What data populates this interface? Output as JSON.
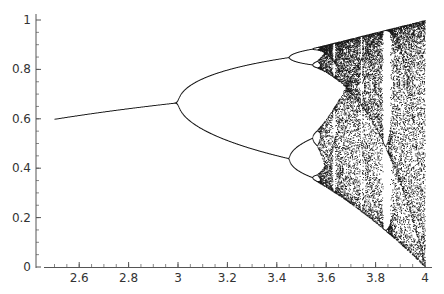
{
  "chart_data": {
    "type": "scatter",
    "title": "",
    "subtitle": "",
    "xlabel": "",
    "ylabel": "",
    "x_range": [
      2.5,
      4.0
    ],
    "xlim": [
      2.45,
      4.0
    ],
    "ylim": [
      0,
      1
    ],
    "x_ticks": [
      2.6,
      2.8,
      3,
      3.2,
      3.4,
      3.6,
      3.8,
      4
    ],
    "x_tick_labels": [
      "2.6",
      "2.8",
      "3",
      "3.2",
      "3.4",
      "3.6",
      "3.8",
      "4"
    ],
    "y_ticks": [
      0,
      0.2,
      0.4,
      0.6,
      0.8,
      1
    ],
    "y_tick_labels": [
      "0",
      "0.2",
      "0.4",
      "0.6",
      "0.8",
      "1"
    ],
    "grid": false,
    "legend": null,
    "point_color": "#1a1a1a",
    "axis_color": "#555555",
    "key_features": {
      "fixed_point_at_r_2.5": 0.6,
      "first_bifurcation_r": 3.0,
      "value_at_first_bifurcation": 0.667,
      "second_bifurcation_r": 3.449,
      "branches_at_r_3.449": [
        0.85,
        0.44
      ],
      "onset_of_chaos_r": 3.57,
      "period_3_window_r": [
        3.83,
        3.86
      ],
      "chaotic_range_at_r_4": [
        0,
        1
      ]
    }
  }
}
